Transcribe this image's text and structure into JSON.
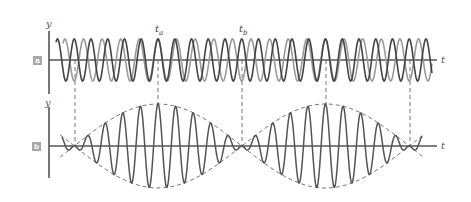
{
  "figure": {
    "panels": [
      {
        "id": "a",
        "label": "a",
        "y_axis_label": "y",
        "x_axis_label": "t",
        "description": "Two sinusoidal waves of slightly different frequency superimposed",
        "series": [
          {
            "name": "wave-1",
            "color": "#444444"
          },
          {
            "name": "wave-2",
            "color": "#9a9a9a"
          }
        ]
      },
      {
        "id": "b",
        "label": "b",
        "y_axis_label": "y",
        "x_axis_label": "t",
        "description": "Resultant wave with dashed beat envelope",
        "series": [
          {
            "name": "resultant",
            "color": "#555555"
          },
          {
            "name": "envelope",
            "color": "#777777",
            "style": "dashed"
          }
        ]
      }
    ],
    "time_markers": [
      {
        "label": "t",
        "subscript": "a"
      },
      {
        "label": "t",
        "subscript": "b"
      }
    ],
    "colors": {
      "axis": "#555555",
      "dark_wave": "#444444",
      "light_wave": "#9a9a9a",
      "dashed": "#777777",
      "label_box": "#a8a8a8"
    }
  }
}
